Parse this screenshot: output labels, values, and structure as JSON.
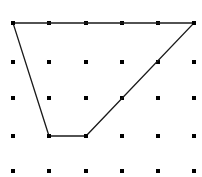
{
  "figure": {
    "kind": "geoboard-dot-grid-polygon",
    "width": 202,
    "height": 177,
    "background_color": "#ffffff"
  },
  "grid": {
    "columns": 6,
    "rows": 5,
    "origin_x": 13,
    "origin_y": 23,
    "spacing_x": 36.2,
    "spacing_y": 37.2,
    "dot_color": "#000000",
    "dot_size": 3.2,
    "dot_shape": "square",
    "points": [
      {
        "col": 0,
        "row": 0,
        "x": 13,
        "y": 23
      },
      {
        "col": 1,
        "row": 0,
        "x": 49,
        "y": 23
      },
      {
        "col": 2,
        "row": 0,
        "x": 86,
        "y": 23
      },
      {
        "col": 3,
        "row": 0,
        "x": 122,
        "y": 23
      },
      {
        "col": 4,
        "row": 0,
        "x": 158,
        "y": 23
      },
      {
        "col": 5,
        "row": 0,
        "x": 194,
        "y": 23
      },
      {
        "col": 0,
        "row": 1,
        "x": 13,
        "y": 62
      },
      {
        "col": 1,
        "row": 1,
        "x": 49,
        "y": 62
      },
      {
        "col": 2,
        "row": 1,
        "x": 86,
        "y": 62
      },
      {
        "col": 3,
        "row": 1,
        "x": 122,
        "y": 62
      },
      {
        "col": 4,
        "row": 1,
        "x": 158,
        "y": 62
      },
      {
        "col": 5,
        "row": 1,
        "x": 194,
        "y": 62
      },
      {
        "col": 0,
        "row": 2,
        "x": 13,
        "y": 98
      },
      {
        "col": 1,
        "row": 2,
        "x": 49,
        "y": 98
      },
      {
        "col": 2,
        "row": 2,
        "x": 86,
        "y": 98
      },
      {
        "col": 3,
        "row": 2,
        "x": 122,
        "y": 98
      },
      {
        "col": 4,
        "row": 2,
        "x": 158,
        "y": 98
      },
      {
        "col": 5,
        "row": 2,
        "x": 194,
        "y": 98
      },
      {
        "col": 0,
        "row": 3,
        "x": 13,
        "y": 136
      },
      {
        "col": 1,
        "row": 3,
        "x": 49,
        "y": 136
      },
      {
        "col": 2,
        "row": 3,
        "x": 86,
        "y": 136
      },
      {
        "col": 3,
        "row": 3,
        "x": 122,
        "y": 136
      },
      {
        "col": 4,
        "row": 3,
        "x": 158,
        "y": 136
      },
      {
        "col": 5,
        "row": 3,
        "x": 194,
        "y": 136
      },
      {
        "col": 0,
        "row": 4,
        "x": 13,
        "y": 171
      },
      {
        "col": 1,
        "row": 4,
        "x": 49,
        "y": 171
      },
      {
        "col": 2,
        "row": 4,
        "x": 86,
        "y": 171
      },
      {
        "col": 3,
        "row": 4,
        "x": 122,
        "y": 171
      },
      {
        "col": 4,
        "row": 4,
        "x": 158,
        "y": 171
      },
      {
        "col": 5,
        "row": 4,
        "x": 194,
        "y": 171
      }
    ]
  },
  "shape": {
    "name": "trapezoid",
    "stroke_color": "#1a1a1a",
    "stroke_width": 1.3,
    "fill": "none",
    "closed": true,
    "vertices": [
      {
        "label": "top-left",
        "col": 0,
        "row": 0,
        "x": 13,
        "y": 23
      },
      {
        "label": "top-right",
        "col": 5,
        "row": 0,
        "x": 194,
        "y": 23
      },
      {
        "label": "bottom-right",
        "col": 2,
        "row": 3,
        "x": 86,
        "y": 136
      },
      {
        "label": "bottom-left",
        "col": 1,
        "row": 3,
        "x": 49,
        "y": 136
      }
    ],
    "path": "M 13 23 L 194 23 L 86 136 L 49 136 Z",
    "edges": [
      {
        "name": "top-edge",
        "from": "top-left",
        "to": "top-right"
      },
      {
        "name": "right-edge",
        "from": "top-right",
        "to": "bottom-right"
      },
      {
        "name": "bottom-edge",
        "from": "bottom-right",
        "to": "bottom-left"
      },
      {
        "name": "left-edge",
        "from": "bottom-left",
        "to": "top-left"
      }
    ]
  }
}
